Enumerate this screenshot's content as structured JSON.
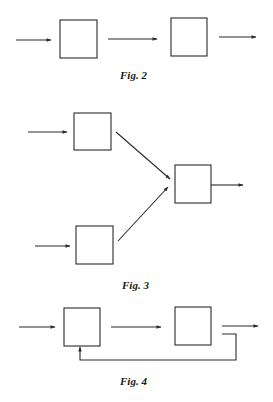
{
  "colors": {
    "stroke": "#2a2a2a",
    "background": "#ffffff"
  },
  "figures": [
    {
      "id": "fig2",
      "caption": "Fig. 2",
      "description": "Two blocks in series: input arrow, block, arrow, block, output arrow"
    },
    {
      "id": "fig3",
      "caption": "Fig. 3",
      "description": "Two input blocks converging via diagonal arrows into a single output block"
    },
    {
      "id": "fig4",
      "caption": "Fig. 4",
      "description": "Two blocks in series with a feedback line from the output of the second block back to the bottom of the first block"
    }
  ]
}
